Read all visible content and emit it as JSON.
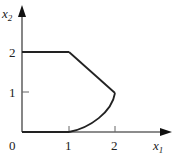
{
  "figure": {
    "type": "feasible-region-diagram",
    "axes": {
      "x": {
        "label": "x",
        "subscript": "1",
        "ticks": [
          "0",
          "1",
          "2"
        ]
      },
      "y": {
        "label": "x",
        "subscript": "2",
        "ticks": [
          "1",
          "2"
        ]
      }
    },
    "region": {
      "boundary": [
        {
          "segment": "line",
          "from": [
            0,
            0
          ],
          "to": [
            1,
            0
          ]
        },
        {
          "segment": "curve",
          "from": [
            1,
            0
          ],
          "to": [
            2,
            1
          ]
        },
        {
          "segment": "line",
          "from": [
            2,
            1
          ],
          "to": [
            1,
            2
          ]
        },
        {
          "segment": "line",
          "from": [
            1,
            2
          ],
          "to": [
            0,
            2
          ]
        },
        {
          "segment": "line",
          "from": [
            0,
            2
          ],
          "to": [
            0,
            0
          ]
        }
      ]
    },
    "colors": {
      "stroke": "#222222",
      "axis": "#555555",
      "background": "#ffffff"
    }
  }
}
